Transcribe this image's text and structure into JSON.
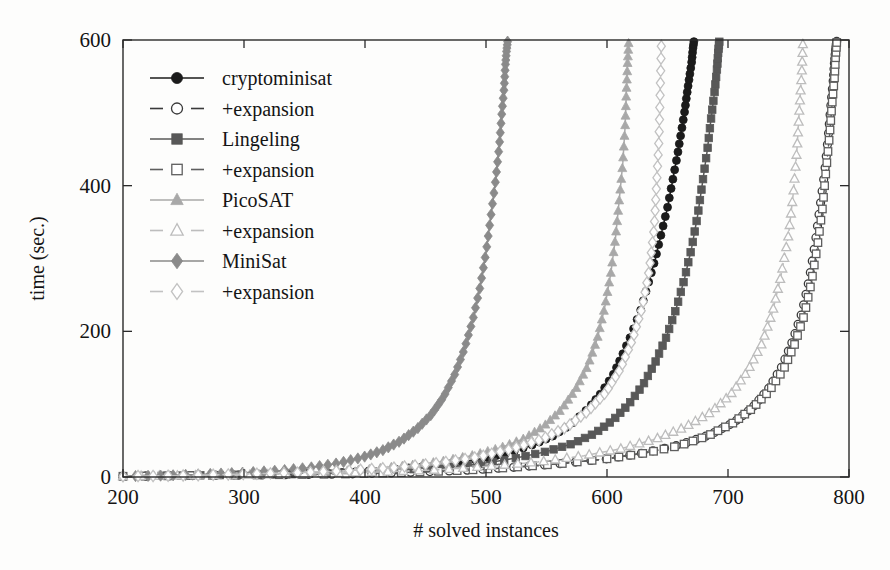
{
  "chart_data": {
    "type": "line",
    "title": "",
    "subtitle": "",
    "xlabel": "# solved instances",
    "ylabel": "time (sec.)",
    "xlim": [
      200,
      800
    ],
    "ylim": [
      0,
      600
    ],
    "xticks": [
      200,
      300,
      400,
      500,
      600,
      700,
      800
    ],
    "yticks": [
      0,
      200,
      400,
      600
    ],
    "grid": false,
    "legend_position": "upper-left",
    "note": "Cactus plot: each series is a cumulative sorted runtime curve; x = number of solved instances, y = time in seconds (600s timeout).",
    "series": [
      {
        "name": "cryptominisat",
        "legend_label": "cryptominisat",
        "marker": "filled-circle",
        "line": "solid",
        "color": "#1b1b1b",
        "x": [
          200,
          250,
          300,
          340,
          380,
          410,
          440,
          470,
          500,
          520,
          540,
          555,
          570,
          585,
          595,
          605,
          612,
          620,
          628,
          634,
          640,
          645,
          650,
          654,
          658,
          661,
          664,
          666,
          668,
          670,
          671,
          672
        ],
        "y": [
          1,
          2,
          3,
          4,
          6,
          9,
          13,
          18,
          26,
          34,
          45,
          56,
          72,
          95,
          115,
          140,
          165,
          195,
          230,
          265,
          300,
          335,
          370,
          405,
          440,
          470,
          500,
          525,
          548,
          570,
          588,
          600
        ]
      },
      {
        "name": "cryptominisat+expansion",
        "legend_label": "+expansion",
        "marker": "open-circle",
        "line": "dashed",
        "color": "#3a3a3a",
        "x": [
          200,
          260,
          320,
          380,
          430,
          480,
          520,
          560,
          600,
          630,
          660,
          685,
          705,
          720,
          733,
          744,
          753,
          761,
          767,
          772,
          776,
          780,
          783,
          785,
          787,
          788,
          789,
          790
        ],
        "y": [
          1,
          2,
          3,
          4,
          6,
          9,
          13,
          18,
          25,
          33,
          44,
          58,
          75,
          95,
          120,
          150,
          185,
          225,
          270,
          320,
          370,
          420,
          470,
          510,
          545,
          570,
          588,
          600
        ]
      },
      {
        "name": "Lingeling",
        "legend_label": "Lingeling",
        "marker": "filled-square",
        "line": "solid",
        "color": "#585858",
        "x": [
          200,
          250,
          300,
          345,
          390,
          425,
          460,
          495,
          525,
          550,
          572,
          590,
          605,
          618,
          630,
          640,
          649,
          657,
          664,
          670,
          675,
          679,
          683,
          686,
          689,
          691,
          692,
          693
        ],
        "y": [
          1,
          2,
          3,
          4,
          6,
          9,
          13,
          18,
          26,
          35,
          46,
          60,
          78,
          100,
          127,
          158,
          192,
          230,
          272,
          315,
          360,
          405,
          450,
          492,
          530,
          562,
          585,
          600
        ]
      },
      {
        "name": "Lingeling+expansion",
        "legend_label": "+expansion",
        "marker": "open-square",
        "line": "dashed",
        "color": "#5e5e5e",
        "x": [
          200,
          260,
          320,
          380,
          430,
          480,
          520,
          560,
          600,
          632,
          660,
          684,
          704,
          720,
          734,
          746,
          755,
          763,
          769,
          774,
          778,
          781,
          784,
          786,
          788,
          789,
          790
        ],
        "y": [
          1,
          2,
          3,
          4,
          6,
          9,
          13,
          18,
          25,
          33,
          43,
          57,
          74,
          94,
          118,
          148,
          182,
          222,
          268,
          318,
          368,
          420,
          470,
          512,
          548,
          578,
          600
        ]
      },
      {
        "name": "PicoSAT",
        "legend_label": "PicoSAT",
        "marker": "filled-triangle",
        "line": "solid",
        "color": "#a8a8a8",
        "x": [
          200,
          245,
          290,
          330,
          368,
          400,
          432,
          462,
          490,
          512,
          532,
          548,
          562,
          574,
          584,
          592,
          598,
          603,
          607,
          610,
          613,
          615,
          616,
          617,
          618
        ],
        "y": [
          1,
          2,
          3,
          5,
          7,
          10,
          15,
          21,
          30,
          40,
          53,
          70,
          92,
          120,
          152,
          190,
          232,
          278,
          328,
          378,
          430,
          482,
          528,
          568,
          600
        ]
      },
      {
        "name": "PicoSAT+expansion",
        "legend_label": "+expansion",
        "marker": "open-triangle",
        "line": "dashed",
        "color": "#bdbdbd",
        "x": [
          200,
          255,
          310,
          365,
          415,
          462,
          505,
          545,
          580,
          612,
          640,
          664,
          685,
          702,
          716,
          728,
          737,
          744,
          750,
          754,
          757,
          759,
          761,
          762
        ],
        "y": [
          1,
          2,
          3,
          5,
          7,
          10,
          15,
          21,
          29,
          39,
          52,
          68,
          88,
          113,
          145,
          183,
          228,
          278,
          332,
          390,
          450,
          505,
          556,
          600
        ]
      },
      {
        "name": "MiniSat",
        "legend_label": "MiniSat",
        "marker": "filled-diamond",
        "line": "solid",
        "color": "#8a8a8a",
        "x": [
          200,
          235,
          270,
          300,
          330,
          355,
          378,
          398,
          415,
          430,
          443,
          455,
          465,
          474,
          482,
          489,
          495,
          500,
          504,
          508,
          511,
          513,
          515,
          516,
          517,
          518
        ],
        "y": [
          1,
          2,
          4,
          6,
          9,
          13,
          19,
          27,
          37,
          50,
          66,
          86,
          110,
          140,
          175,
          215,
          260,
          308,
          358,
          408,
          455,
          498,
          535,
          565,
          585,
          600
        ]
      },
      {
        "name": "MiniSat+expansion",
        "legend_label": "+expansion",
        "marker": "open-diamond",
        "line": "dashed",
        "color": "#c2c2c2",
        "x": [
          200,
          250,
          300,
          345,
          388,
          425,
          460,
          492,
          520,
          545,
          566,
          584,
          599,
          611,
          621,
          629,
          635,
          639,
          641,
          643,
          644,
          645
        ],
        "y": [
          1,
          2,
          4,
          6,
          9,
          13,
          19,
          27,
          38,
          51,
          68,
          90,
          116,
          148,
          188,
          232,
          285,
          342,
          402,
          465,
          532,
          600
        ]
      }
    ]
  },
  "legend": {
    "entries": [
      {
        "label": "cryptominisat",
        "marker": "filled-circle",
        "line": "solid",
        "color": "#1b1b1b"
      },
      {
        "label": "+expansion",
        "marker": "open-circle",
        "line": "dashed",
        "color": "#3a3a3a"
      },
      {
        "label": "Lingeling",
        "marker": "filled-square",
        "line": "solid",
        "color": "#585858"
      },
      {
        "label": "+expansion",
        "marker": "open-square",
        "line": "dashed",
        "color": "#5e5e5e"
      },
      {
        "label": "PicoSAT",
        "marker": "filled-triangle",
        "line": "solid",
        "color": "#a8a8a8"
      },
      {
        "label": "+expansion",
        "marker": "open-triangle",
        "line": "dashed",
        "color": "#bdbdbd"
      },
      {
        "label": "MiniSat",
        "marker": "filled-diamond",
        "line": "solid",
        "color": "#8a8a8a"
      },
      {
        "label": "+expansion",
        "marker": "open-diamond",
        "line": "dashed",
        "color": "#c2c2c2"
      }
    ]
  },
  "axes": {
    "x_tick_labels": [
      "200",
      "300",
      "400",
      "500",
      "600",
      "700",
      "800"
    ],
    "y_tick_labels": [
      "0",
      "200",
      "400",
      "600"
    ],
    "x_title": "# solved instances",
    "y_title": "time (sec.)"
  }
}
